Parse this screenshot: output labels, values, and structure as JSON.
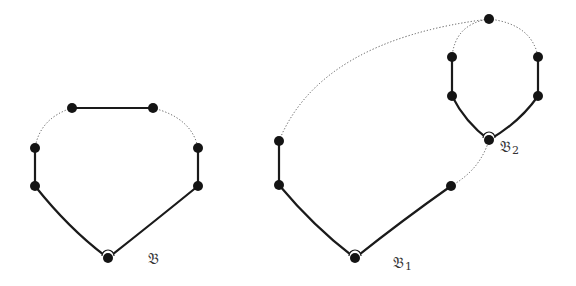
{
  "diagram": {
    "graphs": [
      {
        "id": "B",
        "label": "𝔅",
        "subscript": "",
        "label_pos": [
          148,
          264
        ],
        "nodes": [
          [
            72,
            108
          ],
          [
            153,
            108
          ],
          [
            35,
            148
          ],
          [
            35,
            186
          ],
          [
            198,
            148
          ],
          [
            198,
            186
          ],
          [
            108,
            258
          ]
        ],
        "solid_edges": [
          "M72,108 L153,108",
          "M35,148 L35,186",
          "M198,148 L198,186",
          "M35,186 Q70,230 108,258",
          "M198,186 Q150,225 108,258"
        ],
        "dotted_edges": [
          "M72,108 Q40,118 35,148",
          "M153,108 Q192,118 198,148"
        ],
        "arc_node": [
          108,
          258
        ]
      },
      {
        "id": "B1",
        "label": "𝔅",
        "subscript": "1",
        "label_pos": [
          393,
          268
        ],
        "nodes": [
          [
            279,
            141
          ],
          [
            279,
            185
          ],
          [
            355,
            258
          ],
          [
            451,
            186
          ]
        ],
        "solid_edges": [
          "M279,141 L279,185",
          "M279,185 Q315,228 355,258",
          "M451,186 Q400,222 355,258"
        ],
        "dotted_edges": [
          "M279,141 Q320,40 489,19",
          "M451,186 Q480,170 489,140"
        ],
        "arc_node": [
          355,
          258
        ]
      },
      {
        "id": "B2",
        "label": "𝔅",
        "subscript": "2",
        "label_pos": [
          500,
          152
        ],
        "nodes": [
          [
            489,
            19
          ],
          [
            452,
            57
          ],
          [
            452,
            96
          ],
          [
            538,
            57
          ],
          [
            538,
            96
          ],
          [
            489,
            140
          ]
        ],
        "solid_edges": [
          "M452,57 L452,96",
          "M538,57 L538,96",
          "M452,96 Q465,122 489,140",
          "M538,96 Q520,122 489,140"
        ],
        "dotted_edges": [
          "M489,19 Q455,24 452,57",
          "M489,19 Q532,24 538,57"
        ],
        "arc_node": [
          489,
          140
        ]
      }
    ],
    "colors": {
      "node": "#141414",
      "solid_edge": "#1a1a1a",
      "dotted_edge": "#555555",
      "background": "#ffffff"
    }
  }
}
